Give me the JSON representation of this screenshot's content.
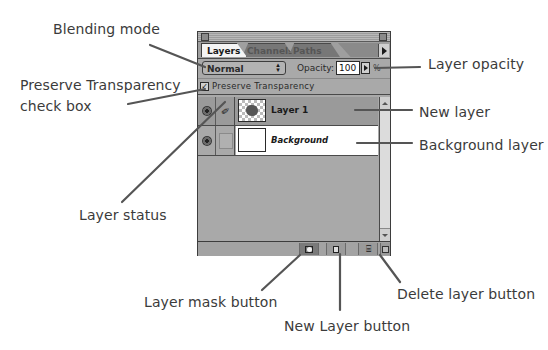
{
  "panel": {
    "tabs": [
      {
        "label": "Layers",
        "active": true
      },
      {
        "label": "Channels",
        "active": false
      },
      {
        "label": "Paths",
        "active": false
      }
    ],
    "blending_mode": "Normal",
    "opacity_label": "Opacity:",
    "opacity_value": "100",
    "opacity_unit": "%",
    "preserve_transparency": {
      "label": "Preserve Transparency",
      "checked": true,
      "mark": "✓"
    },
    "layers": [
      {
        "name": "Layer 1",
        "selected": true,
        "visible": true,
        "status": "brush-icon"
      },
      {
        "name": "Background",
        "selected": false,
        "visible": true,
        "status": "none"
      }
    ],
    "bottom_buttons": [
      {
        "name": "layer-mask-button",
        "icon": "mask-icon"
      },
      {
        "name": "new-layer-button",
        "icon": "new-layer-icon"
      },
      {
        "name": "delete-layer-button",
        "icon": "trash-icon"
      }
    ],
    "icons": {
      "brush": "𝓃",
      "trash": "🗑",
      "mode_arrows": "▲▼"
    }
  },
  "callouts": {
    "blending_mode": "Blending mode",
    "preserve_transparency_line1": "Preserve Transparency",
    "preserve_transparency_line2": "check box",
    "layer_status": "Layer status",
    "layer_opacity": "Layer opacity",
    "new_layer": "New layer",
    "background_layer": "Background layer",
    "layer_mask_button": "Layer mask button",
    "new_layer_button": "New Layer button",
    "delete_layer_button": "Delete layer button"
  }
}
